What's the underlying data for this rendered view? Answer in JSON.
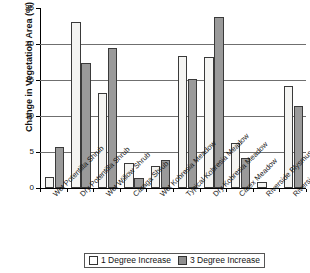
{
  "chart_data": {
    "type": "bar",
    "title": "",
    "xlabel": "",
    "ylabel": "Change in Vegetation Area (%)",
    "ylim": [
      0,
      25
    ],
    "ytick_labels": [
      "0",
      "5",
      "10",
      "15",
      "20",
      "25"
    ],
    "ytick_values": [
      0,
      5,
      10,
      15,
      20,
      25
    ],
    "grid": true,
    "legend_position": "bottom",
    "categories": [
      "Wet Potentilla Shrub",
      "Dry Potentilla Shrub",
      "Wet Willow Shrub",
      "Caraga Shrub",
      "Wet Kobresia Meadow",
      "Typical Kobresia Meadow",
      "Dry Kobresia Meadow",
      "Carex Meadow",
      "Riverside Blysmus Meadow",
      "Riverside Kobresia Meadow"
    ],
    "series": [
      {
        "name": "1 Degree Increase",
        "color": "#f4f4f2",
        "values": [
          1.5,
          23.0,
          13.2,
          3.5,
          3.1,
          18.3,
          18.2,
          6.2,
          0.9,
          14.1
        ]
      },
      {
        "name": "3 Degree Increase",
        "color": "#9a9a9a",
        "values": [
          5.7,
          17.3,
          19.5,
          1.4,
          3.9,
          15.2,
          23.7,
          4.1,
          0.0,
          11.4
        ]
      }
    ]
  },
  "legend": {
    "items": [
      {
        "label": "1 Degree Increase"
      },
      {
        "label": "3 Degree Increase"
      }
    ]
  }
}
